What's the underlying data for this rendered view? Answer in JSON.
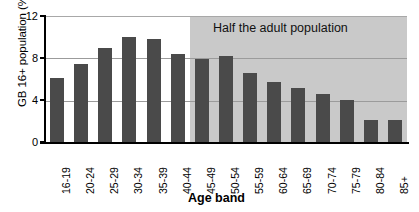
{
  "chart_data": {
    "type": "bar",
    "title": "",
    "xlabel": "Age band",
    "ylabel": "GB 16+ population (%)",
    "ylim": [
      0,
      12
    ],
    "yticks": [
      0,
      4,
      8,
      12
    ],
    "grid": true,
    "legend": "none",
    "categories": [
      "16-19",
      "20-24",
      "25-29",
      "30-34",
      "35-39",
      "40-44",
      "45-49",
      "50-54",
      "55-59",
      "60-64",
      "65-69",
      "70-74",
      "75-79",
      "80-84",
      "85+"
    ],
    "values": [
      6.1,
      7.5,
      9.0,
      10.0,
      9.8,
      8.4,
      7.9,
      8.2,
      6.6,
      5.8,
      5.2,
      4.6,
      4.1,
      2.2,
      2.2
    ],
    "annotations": [
      {
        "text": "Half the adult population",
        "type": "shaded-region-label",
        "region_start_category": "45-49",
        "region_end_category": "85+"
      }
    ],
    "colors": {
      "bar": "#4a4a4a",
      "shaded_region": "#c9c9c9",
      "gridline": "#9b9b9b",
      "axis": "#000000",
      "background": "#ffffff"
    }
  },
  "axes": {
    "y_title": "GB 16+ population (%)",
    "x_title": "Age band",
    "y_tick_labels": [
      "12",
      "8",
      "4",
      "0"
    ]
  },
  "annotation": {
    "label": "Half the adult population"
  }
}
